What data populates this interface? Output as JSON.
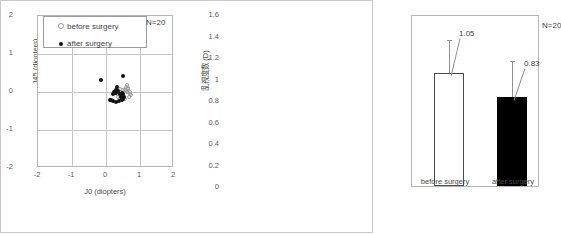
{
  "figure": {
    "panels": [
      "scatter",
      "bar"
    ]
  },
  "chart_data": [
    {
      "type": "scatter",
      "title": "",
      "xlabel": "J0 (diopters)",
      "ylabel": "J45 (diopters)",
      "xlim": [
        -2,
        2
      ],
      "ylim": [
        -2,
        2
      ],
      "xticks": [
        "-2",
        "-1",
        "0",
        "1",
        "2"
      ],
      "yticks": [
        "2",
        "1",
        "0",
        "-1",
        "-2"
      ],
      "grid": true,
      "annotation": "N=20",
      "legend_position": "top-left",
      "series": [
        {
          "name": "before surgery",
          "marker": "open-circle",
          "color": "#9b9b9b",
          "points": [
            [
              0.42,
              0.08
            ],
            [
              0.5,
              0.06
            ],
            [
              0.55,
              0.04
            ],
            [
              0.6,
              0.02
            ],
            [
              0.63,
              -0.01
            ],
            [
              0.66,
              0.1
            ],
            [
              0.7,
              0.0
            ],
            [
              0.72,
              -0.05
            ],
            [
              0.48,
              -0.1
            ],
            [
              0.52,
              -0.14
            ],
            [
              0.4,
              -0.16
            ],
            [
              0.36,
              -0.12
            ],
            [
              0.58,
              0.14
            ],
            [
              0.62,
              0.18
            ],
            [
              0.68,
              -0.12
            ],
            [
              0.74,
              -0.08
            ],
            [
              0.45,
              0.0
            ],
            [
              0.33,
              -0.05
            ],
            [
              0.56,
              -0.18
            ],
            [
              0.64,
              0.08
            ]
          ]
        },
        {
          "name": "after surgery",
          "marker": "solid-circle",
          "color": "#111111",
          "points": [
            [
              -0.14,
              0.31
            ],
            [
              0.5,
              0.42
            ],
            [
              0.33,
              0.13
            ],
            [
              0.28,
              0.06
            ],
            [
              0.24,
              0.0
            ],
            [
              0.21,
              -0.05
            ],
            [
              0.3,
              -0.02
            ],
            [
              0.36,
              0.02
            ],
            [
              0.4,
              -0.06
            ],
            [
              0.46,
              -0.02
            ],
            [
              0.5,
              -0.05
            ],
            [
              0.52,
              -0.12
            ],
            [
              0.5,
              -0.18
            ],
            [
              0.46,
              -0.22
            ],
            [
              0.38,
              -0.24
            ],
            [
              0.3,
              -0.26
            ],
            [
              0.22,
              -0.24
            ],
            [
              0.16,
              -0.2
            ],
            [
              0.12,
              -0.22
            ],
            [
              0.44,
              -0.14
            ]
          ]
        }
      ]
    },
    {
      "type": "bar",
      "title": "",
      "xlabel": "",
      "ylabel": "乱視度数 (D)",
      "categories": [
        "before surgery",
        "after surgery"
      ],
      "values": [
        1.05,
        0.83
      ],
      "value_labels": [
        "1.05",
        "0.83"
      ],
      "errors_upper": [
        0.3,
        0.32
      ],
      "ylim": [
        0,
        1.6
      ],
      "yticks": [
        "1.6",
        "1.4",
        "1.2",
        "1",
        "0.8",
        "0.6",
        "0.4",
        "0.2",
        "0"
      ],
      "grid": false,
      "annotation": "N=20",
      "bar_styles": [
        "open",
        "filled"
      ]
    }
  ]
}
